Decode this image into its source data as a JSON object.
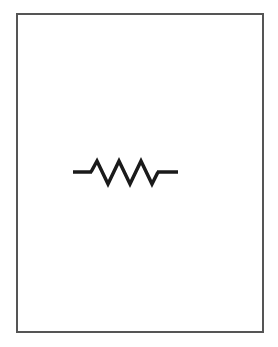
{
  "diagram": {
    "symbol": "resistor",
    "style": "zigzag",
    "peaks": 3,
    "stroke_color": "#1a1a1a",
    "frame_color": "#555555",
    "background": "#ffffff"
  }
}
